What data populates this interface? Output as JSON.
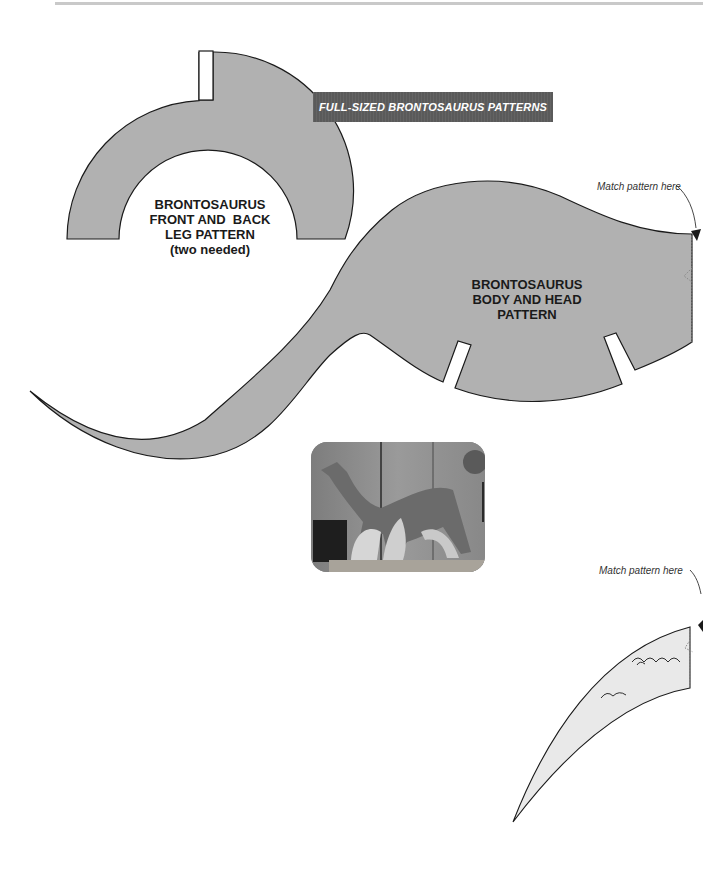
{
  "page": {
    "banner_title": "FULL-SIZED BRONTOSAURUS PATTERNS",
    "accent_colors": {
      "pattern_fill": "#b1b1b1",
      "neck_piece_fill": "#e9e9e9",
      "banner_bg": "#5a5a5a",
      "outline": "#1a1a1a"
    }
  },
  "leg_pattern": {
    "title_lines": [
      "BRONTOSAURUS",
      "FRONT AND  BACK",
      "LEG PATTERN"
    ],
    "note": "(two needed)"
  },
  "body_pattern": {
    "title_lines": [
      "BRONTOSAURUS",
      "BODY AND HEAD",
      "PATTERN"
    ],
    "match_label": "Match pattern here"
  },
  "neck_piece": {
    "match_label": "Match pattern here"
  },
  "photo": {
    "description": "finished-wooden-brontosaurus-photo"
  }
}
